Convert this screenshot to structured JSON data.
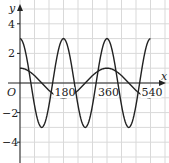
{
  "chart_data": {
    "type": "line",
    "title": "",
    "xlabel": "x",
    "ylabel": "y",
    "origin_label": "O",
    "xlim": [
      0,
      560
    ],
    "ylim": [
      -5,
      5
    ],
    "grid": true,
    "x_ticks": [
      180,
      360,
      540
    ],
    "x_tick_labels": [
      "180",
      "360",
      "540"
    ],
    "y_ticks": [
      4,
      2,
      -2,
      -4
    ],
    "y_tick_labels": [
      "4",
      "2",
      "−2",
      "−4"
    ],
    "series": [
      {
        "name": "y = 3cos(2x)",
        "x": [
          0,
          45,
          90,
          135,
          180,
          225,
          270,
          315,
          360,
          405,
          450,
          495,
          540
        ],
        "values": [
          3,
          0,
          -3,
          0,
          3,
          0,
          -3,
          0,
          3,
          0,
          -3,
          0,
          3
        ]
      },
      {
        "name": "y = cos(x)",
        "x": [
          0,
          90,
          180,
          270,
          360,
          450,
          540
        ],
        "values": [
          1,
          0,
          -1,
          0,
          1,
          0,
          -1
        ]
      }
    ],
    "colors": {
      "curve": "#222222",
      "grid": "#d9d9d9",
      "axis": "#222222"
    }
  }
}
